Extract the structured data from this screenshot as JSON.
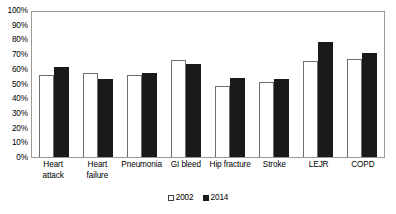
{
  "chart_data": {
    "type": "bar",
    "title": "",
    "subtitle": "",
    "xlabel": "",
    "ylabel": "",
    "ylim": [
      0,
      100
    ],
    "y_ticks": [
      "0%",
      "10%",
      "20%",
      "30%",
      "40%",
      "50%",
      "60%",
      "70%",
      "80%",
      "90%",
      "100%"
    ],
    "y_tick_values": [
      0,
      10,
      20,
      30,
      40,
      50,
      60,
      70,
      80,
      90,
      100
    ],
    "grid": false,
    "legend_position": "bottom-center",
    "categories": [
      "Heart attack",
      "Heart failure",
      "Pneumonia",
      "GI bleed",
      "Hip fracture",
      "Stroke",
      "LEJR",
      "COPD"
    ],
    "category_lines": [
      [
        "Heart",
        "attack"
      ],
      [
        "Heart",
        "failure"
      ],
      [
        "Pneumonia"
      ],
      [
        "GI bleed"
      ],
      [
        "Hip fracture"
      ],
      [
        "Stroke"
      ],
      [
        "LEJR"
      ],
      [
        "COPD"
      ]
    ],
    "series": [
      {
        "name": "2002",
        "color": "#ffffff",
        "edge_color": "#6e6e6e",
        "values": [
          56,
          57,
          56,
          66,
          48,
          51,
          65,
          67
        ]
      },
      {
        "name": "2014",
        "color": "#1a1a1a",
        "edge_color": "#1a1a1a",
        "values": [
          61,
          53,
          57,
          63,
          54,
          53,
          78,
          71
        ]
      }
    ]
  },
  "legend": {
    "items": [
      {
        "label": "2002",
        "swatch": "open-square"
      },
      {
        "label": "2014",
        "swatch": "filled-square"
      }
    ]
  },
  "colors": {
    "plot_border": "#9a9a9a",
    "bar_2002_fill": "#ffffff",
    "bar_2002_edge": "#6e6e6e",
    "bar_2014_fill": "#1a1a1a",
    "text": "#000000",
    "background": "#ffffff"
  }
}
